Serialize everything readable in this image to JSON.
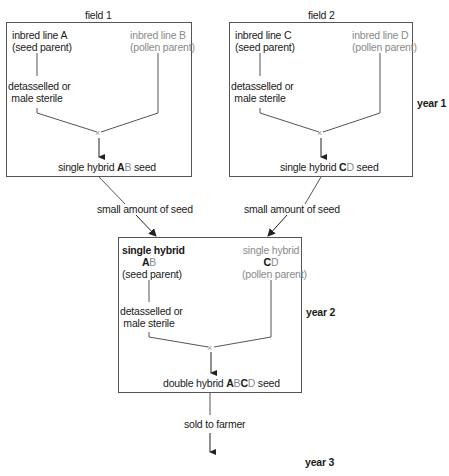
{
  "diagram": {
    "fields": [
      {
        "title": "field 1",
        "seed_parent": {
          "line1": "inbred line A",
          "line2": "(seed parent)"
        },
        "pollen_parent": {
          "line1": "inbred line B",
          "line2": "(pollen parent)"
        },
        "treatment": {
          "line1": "detasselled or",
          "line2": "male sterile"
        },
        "cross_symbol": "×",
        "product": {
          "prefix": "single hybrid ",
          "a": "A",
          "b": "B",
          "suffix": " seed"
        }
      },
      {
        "title": "field 2",
        "seed_parent": {
          "line1": "inbred line C",
          "line2": "(seed parent)"
        },
        "pollen_parent": {
          "line1": "inbred line D",
          "line2": "(pollen parent)"
        },
        "treatment": {
          "line1": "detasselled or",
          "line2": "male sterile"
        },
        "cross_symbol": "×",
        "product": {
          "prefix": "single hybrid ",
          "a": "C",
          "b": "D",
          "suffix": " seed"
        }
      }
    ],
    "transfer_label_left": "small amount of seed",
    "transfer_label_right": "small amount of seed",
    "year2_box": {
      "seed_parent": {
        "line1": "single hybrid",
        "a": "A",
        "b": "B",
        "line3": "(seed parent)"
      },
      "pollen_parent": {
        "line1": "single hybrid",
        "a": "C",
        "b": "D",
        "line3": "(pollen parent)"
      },
      "treatment": {
        "line1": "detasselled or",
        "line2": "male sterile"
      },
      "cross_symbol": "×",
      "product": {
        "prefix": "double hybrid ",
        "a": "A",
        "b": "B",
        "c": "C",
        "d": "D",
        "suffix": " seed"
      }
    },
    "final_label": "sold to farmer",
    "years": [
      "year 1",
      "year 2",
      "year 3"
    ]
  },
  "colors": {
    "line": "#444444",
    "text": "#1a1a1a",
    "pollen_text": "#8a8a8a"
  }
}
